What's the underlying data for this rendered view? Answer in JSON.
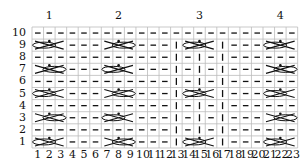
{
  "chart": {
    "group_labels": [
      {
        "label": "1",
        "col": 2
      },
      {
        "label": "2",
        "col": 8
      },
      {
        "label": "3",
        "col": 15
      },
      {
        "label": "4",
        "col": 22
      }
    ],
    "rows": [
      "1",
      "2",
      "3",
      "4",
      "5",
      "6",
      "7",
      "8",
      "9",
      "10"
    ],
    "columns": [
      "1",
      "2",
      "3",
      "4",
      "5",
      "6",
      "7",
      "8",
      "9",
      "10",
      "11",
      "12",
      "13",
      "14",
      "15",
      "16",
      "17",
      "18",
      "19",
      "20",
      "21",
      "22",
      "23"
    ],
    "symbols": {
      "dash": "purl",
      "bar": "knit",
      "cable": "cable-3-st"
    },
    "cable_groups": {
      "all_odd": [
        [
          1,
          3
        ],
        [
          7,
          9
        ],
        [
          21,
          23
        ]
      ],
      "rows_1_5_9": [
        [
          14,
          16
        ]
      ]
    }
  }
}
